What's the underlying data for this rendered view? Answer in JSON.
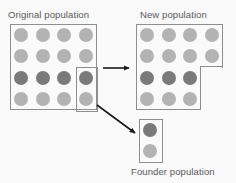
{
  "diagram": {
    "title_original": "Original population",
    "title_new": "New population",
    "title_founder": "Founder population",
    "background_color": "#fafafa",
    "outline_color": "#8e8e90",
    "text_color": "#58585a",
    "colors": {
      "light_allele": "#b3b3b3",
      "dark_allele": "#7a7a7a"
    },
    "original_population": {
      "rows": 4,
      "columns": 4,
      "total_individuals": 16,
      "grid": [
        [
          "light",
          "light",
          "light",
          "light"
        ],
        [
          "light",
          "light",
          "light",
          "light"
        ],
        [
          "dark",
          "dark",
          "dark",
          "dark"
        ],
        [
          "light",
          "light",
          "light",
          "light"
        ]
      ],
      "selection": {
        "label": "founder-selection",
        "column": 4,
        "rows": [
          3,
          4
        ],
        "selected_individuals": [
          "dark",
          "light"
        ]
      }
    },
    "new_population": {
      "rows": 4,
      "columns": 4,
      "total_individuals": 14,
      "notch": "bottom-right 2 cells removed",
      "grid": [
        [
          "light",
          "light",
          "light",
          "light"
        ],
        [
          "light",
          "light",
          "light",
          "light"
        ],
        [
          "dark",
          "dark",
          "dark",
          null
        ],
        [
          "light",
          "light",
          "light",
          null
        ]
      ]
    },
    "founder_population": {
      "rows": 2,
      "columns": 1,
      "total_individuals": 2,
      "grid": [
        [
          "dark"
        ],
        [
          "light"
        ]
      ]
    },
    "arrows": [
      {
        "name": "arrow-to-new-population",
        "from": [
          103,
          68
        ],
        "to": [
          133,
          68
        ],
        "direction": "right"
      },
      {
        "name": "arrow-to-founder-population",
        "from": [
          97,
          105
        ],
        "to": [
          139,
          136
        ],
        "direction": "down-right"
      }
    ]
  }
}
